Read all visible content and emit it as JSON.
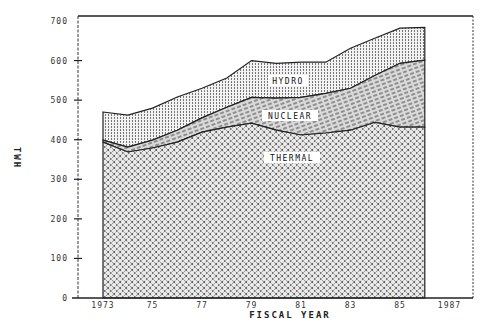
{
  "chart_data": {
    "type": "area",
    "stacked": true,
    "title": "",
    "xlabel": "FISCAL YEAR",
    "ylabel": "TWH",
    "ylim": [
      0,
      700
    ],
    "yticks": [
      0,
      100,
      200,
      300,
      400,
      500,
      600,
      700
    ],
    "ytick_labels": [
      "0",
      "100",
      "200",
      "300",
      "400",
      "500",
      "600",
      "700"
    ],
    "xticks": [
      1973,
      1975,
      1977,
      1979,
      1981,
      1983,
      1985,
      1987
    ],
    "xtick_labels": [
      "1973",
      "75",
      "77",
      "79",
      "81",
      "83",
      "85",
      "1987"
    ],
    "xlim": [
      1972.0,
      1988.0
    ],
    "grid": false,
    "legend": "inline labels",
    "x": [
      1973,
      1974,
      1975,
      1976,
      1977,
      1978,
      1979,
      1980,
      1981,
      1982,
      1983,
      1984,
      1985,
      1986
    ],
    "series": [
      {
        "name": "THERMAL",
        "pattern": "crosshatch",
        "values": [
          394,
          369,
          379,
          394,
          419,
          432,
          442,
          424,
          412,
          417,
          424,
          444,
          432,
          432
        ]
      },
      {
        "name": "NUCLEAR",
        "pattern": "diagonal-dashes",
        "values": [
          5,
          12,
          20,
          30,
          36,
          50,
          65,
          81,
          95,
          100,
          106,
          119,
          161,
          169
        ]
      },
      {
        "name": "HYDRO",
        "pattern": "vertical-dots",
        "values": [
          71,
          81,
          81,
          84,
          75,
          74,
          93,
          88,
          89,
          79,
          101,
          94,
          89,
          83
        ]
      }
    ],
    "cumulative_tops": {
      "THERMAL": [
        394,
        369,
        379,
        394,
        419,
        432,
        442,
        424,
        412,
        417,
        424,
        444,
        432,
        432
      ],
      "NUCLEAR": [
        399,
        381,
        399,
        424,
        455,
        482,
        507,
        505,
        507,
        517,
        530,
        563,
        593,
        601
      ],
      "HYDRO": [
        470,
        462,
        480,
        508,
        530,
        556,
        600,
        593,
        596,
        596,
        631,
        657,
        682,
        684
      ]
    },
    "annotations": [
      {
        "text": "HYDRO",
        "x": 1980.3,
        "y": 560
      },
      {
        "text": "NUCLEAR",
        "x": 1980.6,
        "y": 470
      },
      {
        "text": "THERMAL",
        "x": 1980.6,
        "y": 355
      }
    ]
  },
  "labels": {
    "ylabel": "TWH",
    "xlabel": "FISCAL YEAR",
    "hydro": "HYDRO",
    "nuclear": "NUCLEAR",
    "thermal": "THERMAL"
  }
}
